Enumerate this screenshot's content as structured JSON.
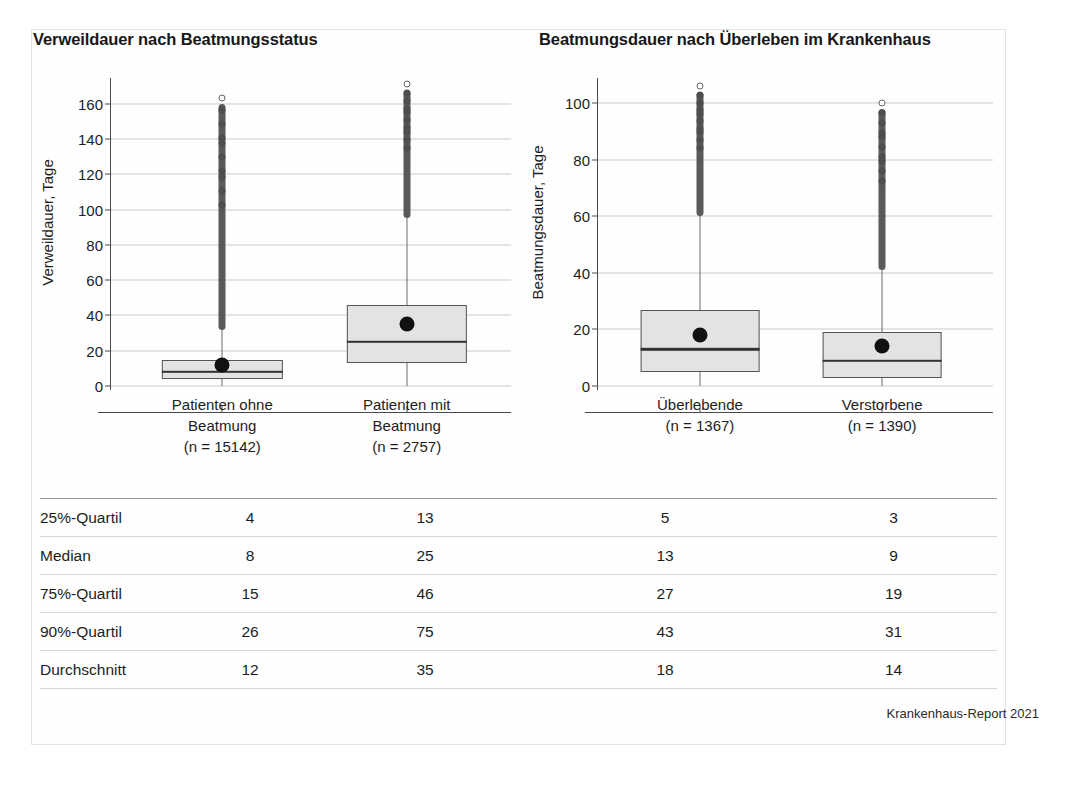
{
  "figure": {
    "source_note": "Krankenhaus-Report 2021"
  },
  "charts": [
    {
      "id": "verweildauer",
      "title": "Verweildauer nach Beatmungsstatus",
      "ylabel": "Verweildauer, Tage",
      "yticks": [
        "0",
        "20",
        "40",
        "60",
        "80",
        "100",
        "120",
        "140",
        "160"
      ],
      "categories": [
        {
          "line1": "Patienten ohne",
          "line2": "Beatmung",
          "line3": "(n = 15142)"
        },
        {
          "line1": "Patienten mit",
          "line2": "Beatmung",
          "line3": "(n = 2757)"
        }
      ]
    },
    {
      "id": "beatmungsdauer",
      "title": "Beatmungsdauer nach Überleben im Krankenhaus",
      "ylabel": "Beatmungsdauer, Tage",
      "yticks": [
        "0",
        "20",
        "40",
        "60",
        "80",
        "100"
      ],
      "categories": [
        {
          "line1": "Überlebende",
          "line2": "(n = 1367)",
          "line3": ""
        },
        {
          "line1": "Verstorbene",
          "line2": "(n = 1390)",
          "line3": ""
        }
      ]
    }
  ],
  "chart_data": [
    {
      "type": "box",
      "title": "Verweildauer nach Beatmungsstatus",
      "xlabel": "",
      "ylabel": "Verweildauer, Tage",
      "ylim": [
        0,
        170
      ],
      "yticks": [
        0,
        20,
        40,
        60,
        80,
        100,
        120,
        140,
        160
      ],
      "grid": true,
      "legend": "none",
      "categories": [
        "Patienten ohne Beatmung (n = 15142)",
        "Patienten mit Beatmung (n = 2757)"
      ],
      "boxes": [
        {
          "name": "Patienten ohne Beatmung",
          "n": 15142,
          "q25": 4,
          "median": 8,
          "q75": 15,
          "q90": 26,
          "mean": 12,
          "whisker_low": 0,
          "whisker_high": 32,
          "outlier_range": [
            32,
            160
          ],
          "max_outlier": 160
        },
        {
          "name": "Patienten mit Beatmung",
          "n": 2757,
          "q25": 13,
          "median": 25,
          "q75": 46,
          "q90": 75,
          "mean": 35,
          "whisker_low": 0,
          "whisker_high": 95,
          "outlier_range": [
            95,
            168
          ],
          "max_outlier": 168
        }
      ]
    },
    {
      "type": "box",
      "title": "Beatmungsdauer nach Überleben im Krankenhaus",
      "xlabel": "",
      "ylabel": "Beatmungsdauer, Tage",
      "ylim": [
        0,
        106
      ],
      "yticks": [
        0,
        20,
        40,
        60,
        80,
        100
      ],
      "grid": true,
      "legend": "none",
      "categories": [
        "Überlebende (n = 1367)",
        "Verstorbene (n = 1390)"
      ],
      "boxes": [
        {
          "name": "Überlebende",
          "n": 1367,
          "q25": 5,
          "median": 13,
          "q75": 27,
          "q90": 43,
          "mean": 18,
          "whisker_low": 0,
          "whisker_high": 60,
          "outlier_range": [
            60,
            104
          ],
          "max_outlier": 104
        },
        {
          "name": "Verstorbene",
          "n": 1390,
          "q25": 3,
          "median": 9,
          "q75": 19,
          "q90": 31,
          "mean": 14,
          "whisker_low": 0,
          "whisker_high": 41,
          "outlier_range": [
            41,
            98
          ],
          "max_outlier": 98
        }
      ]
    }
  ],
  "table": {
    "rows": [
      {
        "label": "25%-Quartil",
        "v1": "4",
        "v2": "13",
        "v3": "5",
        "v4": "3"
      },
      {
        "label": "Median",
        "v1": "8",
        "v2": "25",
        "v3": "13",
        "v4": "9"
      },
      {
        "label": "75%-Quartil",
        "v1": "15",
        "v2": "46",
        "v3": "27",
        "v4": "19"
      },
      {
        "label": "90%-Quartil",
        "v1": "26",
        "v2": "75",
        "v3": "43",
        "v4": "31"
      },
      {
        "label": "Durchschnitt",
        "v1": "12",
        "v2": "35",
        "v3": "18",
        "v4": "14"
      }
    ]
  }
}
